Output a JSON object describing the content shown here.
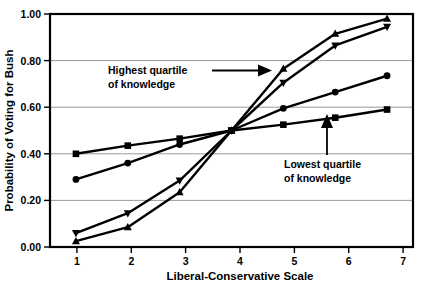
{
  "chart_data": {
    "type": "line",
    "title": "",
    "xlabel": "Liberal-Conservative Scale",
    "ylabel": "Probability of Voting for Bush",
    "x": [
      1,
      2,
      3,
      4,
      5,
      6,
      7
    ],
    "xtick_labels": [
      "1",
      "2",
      "3",
      "4",
      "5",
      "6",
      "7"
    ],
    "ytick_labels": [
      "0.00",
      "0.20",
      "0.40",
      "0.60",
      "0.80",
      "1.00"
    ],
    "ytick_values": [
      0.0,
      0.2,
      0.4,
      0.6,
      0.8,
      1.0
    ],
    "xlim": [
      0.5,
      7.5
    ],
    "ylim": [
      0.0,
      1.0
    ],
    "grid": "horizontal",
    "legend": "none",
    "series": [
      {
        "name": "Highest quartile of knowledge",
        "marker": "triangle-up",
        "color": "#000000",
        "values": [
          0.025,
          0.085,
          0.235,
          0.5,
          0.765,
          0.915,
          0.98
        ]
      },
      {
        "name": "Second highest quartile",
        "marker": "triangle-down",
        "color": "#000000",
        "values": [
          0.06,
          0.145,
          0.285,
          0.5,
          0.705,
          0.865,
          0.945
        ]
      },
      {
        "name": "Third quartile",
        "marker": "circle",
        "color": "#000000",
        "values": [
          0.29,
          0.36,
          0.44,
          0.5,
          0.595,
          0.665,
          0.735
        ]
      },
      {
        "name": "Lowest quartile of knowledge",
        "marker": "square",
        "color": "#000000",
        "values": [
          0.4,
          0.435,
          0.465,
          0.5,
          0.525,
          0.555,
          0.59
        ]
      }
    ],
    "annotations": [
      {
        "id": "highest-quartile",
        "line1": "Highest quartile",
        "line2": "of knowledge",
        "arrow": "right"
      },
      {
        "id": "lowest-quartile",
        "line1": "Lowest quartile",
        "line2": "of knowledge",
        "arrow": "up"
      }
    ]
  },
  "colors": {
    "ink": "#000000",
    "grid": "#808080",
    "background": "#ffffff"
  }
}
